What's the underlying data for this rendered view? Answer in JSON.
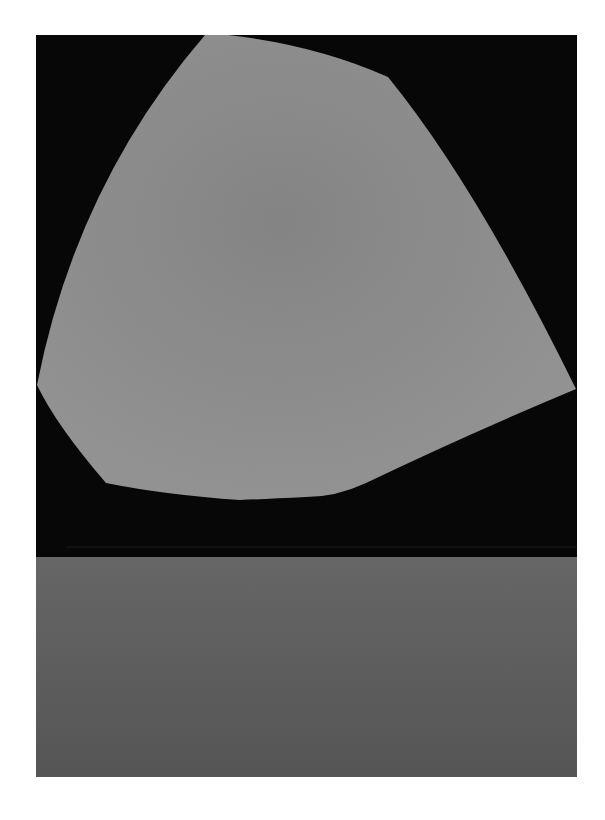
{
  "artwork": {
    "description": "Abstract painting: light gray curved polygon on black field above a dark gray horizontal band",
    "colors": {
      "page_background": "#ffffff",
      "field": "#070707",
      "shape": "#8a8a8a",
      "band": "#5a5a5a"
    }
  }
}
